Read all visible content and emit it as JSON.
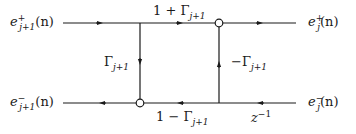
{
  "diagram": {
    "type": "lattice-section-signal-flow",
    "nodes": {
      "input_forward": {
        "base": "e",
        "sup": "+",
        "sub": "j+1",
        "arg": "(n)"
      },
      "output_forward": {
        "base": "e",
        "sup": "+",
        "sub": "j",
        "arg": "(n)"
      },
      "output_backward": {
        "base": "e",
        "sup": "−",
        "sub": "j+1",
        "arg": "(n)"
      },
      "input_backward": {
        "base": "e",
        "sup": "−",
        "sub": "j",
        "arg": "(n)"
      }
    },
    "gains": {
      "top": {
        "prefix": "1 + ",
        "sym": "Γ",
        "sub": "j+1"
      },
      "left_vertical": {
        "prefix": "",
        "sym": "Γ",
        "sub": "j+1"
      },
      "right_vertical": {
        "prefix": "−",
        "sym": "Γ",
        "sub": "j+1"
      },
      "bottom": {
        "prefix": "1 − ",
        "sym": "Γ",
        "sub": "j+1"
      },
      "delay": {
        "base": "z",
        "sup": "−1"
      }
    },
    "colors": {
      "line": "#1a1a1a",
      "background": "#ffffff"
    }
  }
}
